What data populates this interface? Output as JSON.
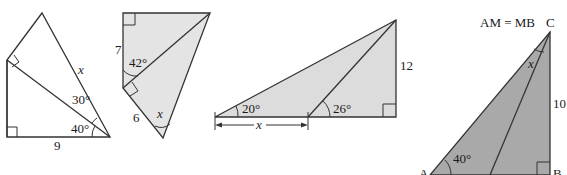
{
  "colors": {
    "stroke": "#333333",
    "fill_fig1": "#ffffff",
    "fill_fig2": "#e4e4e4",
    "fill_fig3": "#dcdcdc",
    "fill_fig4": "#a9a9a9"
  },
  "figures": [
    {
      "id": "fig1",
      "labels": {
        "x": "x",
        "angle_top": "30°",
        "angle_bottom": "40°",
        "base": "9"
      }
    },
    {
      "id": "fig2",
      "labels": {
        "side_left": "7",
        "angle": "42°",
        "side_bottom": "6",
        "x": "x"
      }
    },
    {
      "id": "fig3",
      "labels": {
        "angle_left": "20°",
        "angle_right": "26°",
        "height": "12",
        "x": "x"
      }
    },
    {
      "id": "fig4",
      "labels": {
        "condition": "AM = MB",
        "vertex_c": "C",
        "vertex_a": "A",
        "vertex_b": "B",
        "vertex_m": "M",
        "angle_a": "40°",
        "height": "10",
        "x": "x"
      }
    }
  ]
}
